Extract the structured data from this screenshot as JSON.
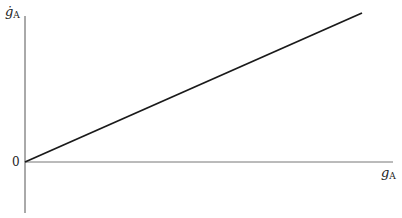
{
  "diagram": {
    "y_axis_label": {
      "symbol": "ġ",
      "subscript": "A"
    },
    "x_axis_label": {
      "symbol": "g",
      "subscript": "A"
    },
    "origin_label": "0",
    "line": {
      "from": [
        25,
        162
      ],
      "to": [
        362,
        13
      ],
      "color": "#1a1a1a"
    },
    "axis_color": "#555555"
  }
}
